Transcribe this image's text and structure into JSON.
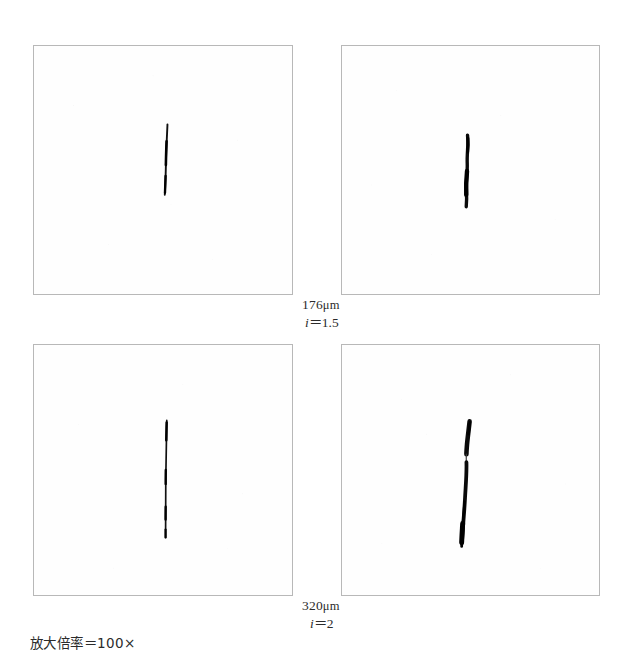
{
  "figure": {
    "caption": "放大倍率＝100×",
    "magnification_value": "100×",
    "panel_count": 4,
    "layout": "2x2-grid"
  },
  "row_labels": [
    {
      "scale": "176μm",
      "scale_value": 176,
      "scale_unit": "μm",
      "index": "i=1.5",
      "index_symbol": "i",
      "index_value": "1.5"
    },
    {
      "scale": "320μm",
      "scale_value": 320,
      "scale_unit": "μm",
      "index": "i=2",
      "index_symbol": "i",
      "index_value": "2"
    }
  ],
  "panels": [
    {
      "id": "panel-top-left",
      "position": "top-left",
      "crack_description": "thin short vertical crack, slightly tilted",
      "border_color": "#b8b8b8",
      "background_color": "#fefefe",
      "crack_color": "#111111"
    },
    {
      "id": "panel-top-right",
      "position": "top-right",
      "crack_description": "medium thick vertical crack with S curve",
      "border_color": "#b8b8b8",
      "background_color": "#fefefe",
      "crack_color": "#111111"
    },
    {
      "id": "panel-bottom-left",
      "position": "bottom-left",
      "crack_description": "long thin near-straight vertical crack",
      "border_color": "#b8b8b8",
      "background_color": "#fefefe",
      "crack_color": "#111111"
    },
    {
      "id": "panel-bottom-right",
      "position": "bottom-right",
      "crack_description": "long thick vertical crack with narrow waist and wedge ends",
      "border_color": "#b8b8b8",
      "background_color": "#fefefe",
      "crack_color": "#111111"
    }
  ]
}
